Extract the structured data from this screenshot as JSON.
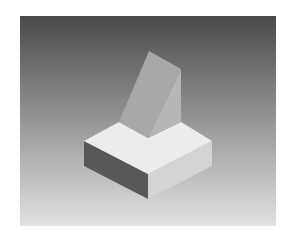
{
  "scene": {
    "description": "Shaded 3D isometric render of an L-shaped block with a slanted wedge rising from its back corner",
    "background": {
      "gradient_top": "#4a4a4a",
      "gradient_bottom": "#e2e2e2"
    },
    "colors": {
      "base_top": "#ececec",
      "base_left": "#585858",
      "base_right": "#d4d4d4",
      "wedge_slope": "#a8a8a8",
      "wedge_right": "#b6b6b6"
    }
  }
}
